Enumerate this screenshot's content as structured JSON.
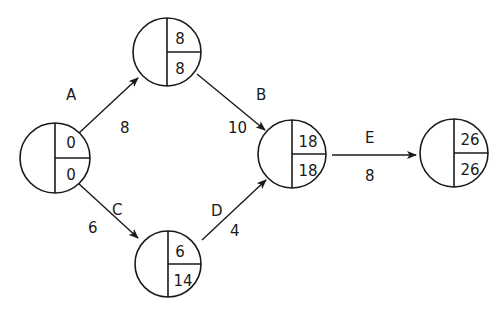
{
  "diagram": {
    "type": "activity-on-arrow network",
    "nodes": [
      {
        "id": "n1",
        "earliest": "0",
        "latest": "0"
      },
      {
        "id": "n2",
        "earliest": "8",
        "latest": "8"
      },
      {
        "id": "n3",
        "earliest": "6",
        "latest": "14"
      },
      {
        "id": "n4",
        "earliest": "18",
        "latest": "18"
      },
      {
        "id": "n5",
        "earliest": "26",
        "latest": "26"
      }
    ],
    "edges": [
      {
        "from": "n1",
        "to": "n2",
        "activity": "A",
        "duration": "8"
      },
      {
        "from": "n2",
        "to": "n4",
        "activity": "B",
        "duration": "10"
      },
      {
        "from": "n1",
        "to": "n3",
        "activity": "C",
        "duration": "6"
      },
      {
        "from": "n3",
        "to": "n4",
        "activity": "D",
        "duration": "4"
      },
      {
        "from": "n4",
        "to": "n5",
        "activity": "E",
        "duration": "8"
      }
    ]
  }
}
